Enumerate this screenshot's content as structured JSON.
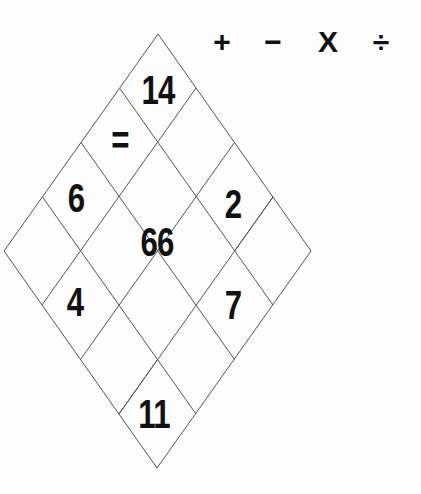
{
  "operators": [
    "+",
    "−",
    "X",
    "÷"
  ],
  "puzzle": {
    "cells": {
      "top": "14",
      "equals": "=",
      "left_upper": "6",
      "right_upper": "2",
      "center": "66",
      "left_lower": "4",
      "right_lower": "7",
      "bottom": "11"
    },
    "line_color": "#555555"
  }
}
